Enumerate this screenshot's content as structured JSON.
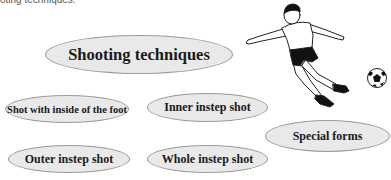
{
  "caption": "oting techniques:",
  "diagram": {
    "title": "Shooting techniques",
    "nodes": [
      {
        "id": "inside-foot",
        "label": "Shot with inside of the foot"
      },
      {
        "id": "inner-instep",
        "label": "Inner instep shot"
      },
      {
        "id": "special-forms",
        "label": "Special forms"
      },
      {
        "id": "outer-instep",
        "label": "Outer instep shot"
      },
      {
        "id": "whole-instep",
        "label": "Whole instep shot"
      }
    ]
  },
  "illustration": {
    "subject": "soccer player kicking ball",
    "icons": [
      "player-figure-icon",
      "soccer-ball-icon"
    ]
  },
  "colors": {
    "ellipse_fill": "#e9e9e9",
    "ellipse_border": "#9a9a9a",
    "text": "#1a1a1a"
  }
}
